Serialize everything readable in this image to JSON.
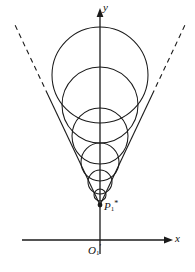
{
  "figure": {
    "background_color": "#ffffff",
    "stroke_color": "#1a1a1a",
    "axis_color": "#1a1a1a",
    "width": 195,
    "height": 272
  },
  "axes": {
    "x_axis": {
      "label": "x",
      "icon": "arrow-right-icon",
      "y": 240,
      "x_start": 22,
      "x_end": 172
    },
    "y_axis": {
      "label": "y",
      "icon": "arrow-up-icon",
      "x": 100,
      "y_start": 254,
      "y_end": 10
    },
    "origin": {
      "label_base": "O",
      "label_sub": "1",
      "label_prime": "′",
      "x": 100,
      "y": 240
    }
  },
  "points": [
    {
      "name": "apex-point",
      "label_base": "P",
      "label_sub": "1",
      "label_sup": "*",
      "x": 100,
      "y": 205,
      "marker": "filled-dot"
    }
  ],
  "tangent_lines": [
    {
      "name": "left-tangent-line",
      "solid_from": {
        "x": 100,
        "y": 205
      },
      "solid_to": {
        "x": 48,
        "y": 95
      },
      "dashed_from": {
        "x": 48,
        "y": 95
      },
      "dashed_to": {
        "x": 15,
        "y": 25
      },
      "style": "solid-then-dashed"
    },
    {
      "name": "right-tangent-line",
      "solid_from": {
        "x": 100,
        "y": 205
      },
      "solid_to": {
        "x": 152,
        "y": 95
      },
      "dashed_from": {
        "x": 152,
        "y": 95
      },
      "dashed_to": {
        "x": 185,
        "y": 25
      },
      "style": "solid-then-dashed"
    }
  ],
  "circles": [
    {
      "name": "circle-1-largest",
      "cx": 100,
      "cy": 75,
      "r": 48
    },
    {
      "name": "circle-2",
      "cx": 100,
      "cy": 105,
      "r": 38
    },
    {
      "name": "circle-3",
      "cx": 100,
      "cy": 136,
      "r": 28
    },
    {
      "name": "circle-4",
      "cx": 100,
      "cy": 162,
      "r": 19
    },
    {
      "name": "circle-5",
      "cx": 100,
      "cy": 182,
      "r": 12
    },
    {
      "name": "circle-6-smallest",
      "cx": 100,
      "cy": 195,
      "r": 6
    }
  ],
  "chart_data": {
    "type": "scatter",
    "xlabel": "x",
    "ylabel": "y",
    "grid": false,
    "legend": null,
    "annotations": [
      {
        "text": "O₁′",
        "role": "origin"
      },
      {
        "text": "P₁*",
        "role": "apex-vertex"
      }
    ],
    "series": [
      {
        "name": "inscribed-circles",
        "kind": "circles",
        "centers_x": [
          100,
          100,
          100,
          100,
          100,
          100
        ],
        "centers_y": [
          75,
          105,
          136,
          162,
          182,
          195
        ],
        "radii": [
          48,
          38,
          28,
          19,
          12,
          6
        ]
      },
      {
        "name": "tangent-rays",
        "kind": "lines",
        "x": [
          [
            100,
            15
          ],
          [
            100,
            185
          ]
        ],
        "y": [
          [
            205,
            25
          ],
          [
            205,
            25
          ]
        ]
      }
    ]
  }
}
